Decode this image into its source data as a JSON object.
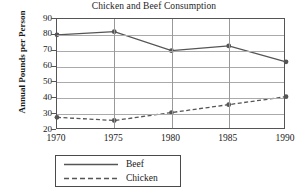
{
  "chart_data": {
    "type": "line",
    "title": "Chicken and Beef Consumption",
    "xlabel": "",
    "ylabel": "Annual Pounds per Person",
    "x": [
      1970,
      1975,
      1980,
      1985,
      1990
    ],
    "xticklabels": [
      "1970",
      "1975",
      "1980",
      "1985",
      "1990"
    ],
    "xlim": [
      1970,
      1990
    ],
    "ylim": [
      20,
      90
    ],
    "yticks": [
      20,
      30,
      40,
      50,
      60,
      70,
      80,
      90
    ],
    "yticklabels": [
      "20",
      "30",
      "40",
      "50",
      "60",
      "70",
      "80",
      "90"
    ],
    "grid": true,
    "legend_position": "below-center",
    "series": [
      {
        "name": "Beef",
        "style": "solid",
        "color": "#555555",
        "marker": "circle",
        "values": [
          80,
          82,
          70,
          73,
          63
        ]
      },
      {
        "name": "Chicken",
        "style": "dashed",
        "color": "#555555",
        "marker": "circle",
        "values": [
          28,
          26,
          31,
          36,
          41
        ]
      }
    ]
  },
  "legend": {
    "items": [
      {
        "label": "Beef"
      },
      {
        "label": "Chicken"
      }
    ]
  }
}
